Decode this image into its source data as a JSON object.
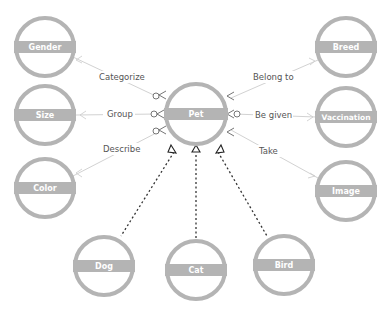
{
  "diagram": {
    "colors": {
      "node": "#b4b4b4",
      "edge": "#cfcfcf",
      "dashed": "#333333",
      "label": "#555555"
    },
    "center": {
      "label": "Pet",
      "x": 196,
      "y": 114
    },
    "nodes": [
      {
        "id": "gender",
        "label": "Gender",
        "x": 45,
        "y": 47
      },
      {
        "id": "size",
        "label": "Size",
        "x": 45,
        "y": 115
      },
      {
        "id": "color",
        "label": "Color",
        "x": 45,
        "y": 188
      },
      {
        "id": "breed",
        "label": "Breed",
        "x": 346,
        "y": 47
      },
      {
        "id": "vaccination",
        "label": "Vaccination",
        "x": 346,
        "y": 117
      },
      {
        "id": "image",
        "label": "Image",
        "x": 346,
        "y": 191
      },
      {
        "id": "dog",
        "label": "Dog",
        "x": 104,
        "y": 266
      },
      {
        "id": "cat",
        "label": "Cat",
        "x": 196,
        "y": 270
      },
      {
        "id": "bird",
        "label": "Bird",
        "x": 284,
        "y": 265
      }
    ],
    "relations": [
      {
        "from": "pet",
        "to": "gender",
        "label": "Categorize"
      },
      {
        "from": "pet",
        "to": "size",
        "label": "Group"
      },
      {
        "from": "pet",
        "to": "color",
        "label": "Describe"
      },
      {
        "from": "pet",
        "to": "breed",
        "label": "Belong to"
      },
      {
        "from": "pet",
        "to": "vaccination",
        "label": "Be given"
      },
      {
        "from": "pet",
        "to": "image",
        "label": "Take"
      }
    ],
    "inheritance": [
      "dog",
      "cat",
      "bird"
    ]
  }
}
